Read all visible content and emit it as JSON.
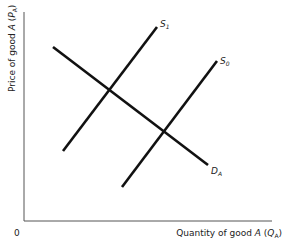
{
  "diagram": {
    "type": "supply-demand",
    "y_axis_label": {
      "prefix": "Price of good ",
      "var": "A",
      "open": " (",
      "sym": "P",
      "sub": "A",
      "close": ")"
    },
    "x_axis_label": {
      "prefix": "Quantity of good ",
      "var": "A",
      "open": " (",
      "sym": "Q",
      "sub": "A",
      "close": ")"
    },
    "origin_label": "0",
    "curves": [
      {
        "id": "S1",
        "name": "S",
        "sub": "1",
        "kind": "supply"
      },
      {
        "id": "S0",
        "name": "S",
        "sub": "0",
        "kind": "supply"
      },
      {
        "id": "DA",
        "name": "D",
        "sub": "A",
        "kind": "demand"
      }
    ],
    "line_color": "#111111",
    "axis_color": "#555555"
  }
}
